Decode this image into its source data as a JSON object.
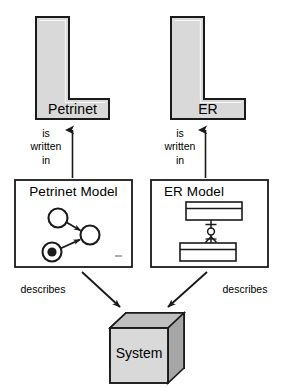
{
  "diagram": {
    "background_color": "#ffffff",
    "stroke_color": "#1a1a1a",
    "shape_fill": "#d9d9d9",
    "box_fill": "#ffffff",
    "cube_top_fill": "#bfbfbf",
    "cube_side_fill": "#a6a6a6"
  },
  "languages": [
    {
      "id": "petrinet-language",
      "label": "Petrinet",
      "shape": "l-shape"
    },
    {
      "id": "er-language",
      "label": "ER",
      "shape": "l-shape"
    }
  ],
  "relations": {
    "written_in": "is\nwritten\nin",
    "describes_left": "describes",
    "describes_right": "describes"
  },
  "models": [
    {
      "id": "petrinet-model",
      "title": "Petrinet Model",
      "content": {
        "type": "petri-net",
        "places": [
          {
            "name": "place-top-left",
            "tokens": 0
          },
          {
            "name": "place-right",
            "tokens": 0
          },
          {
            "name": "place-bottom-left",
            "tokens": 1
          }
        ],
        "arcs": [
          {
            "from": "place-top-left",
            "to": "place-right"
          },
          {
            "from": "place-bottom-left",
            "to": "place-right"
          }
        ]
      }
    },
    {
      "id": "er-model",
      "title": "ER Model",
      "content": {
        "type": "entity-relationship",
        "entities": [
          {
            "name": "entity-top"
          },
          {
            "name": "entity-bottom"
          }
        ],
        "relationships": [
          {
            "from": "entity-top",
            "to": "entity-bottom",
            "notation": "crows-foot-optional"
          }
        ]
      }
    }
  ],
  "system": {
    "label": "System",
    "shape": "cube"
  }
}
